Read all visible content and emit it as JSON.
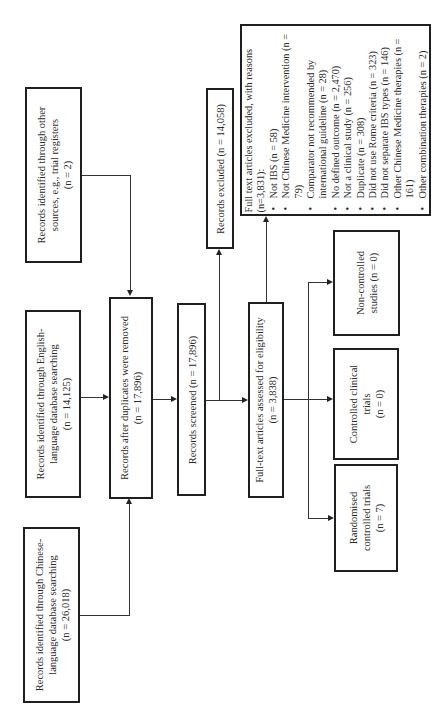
{
  "diagram_type": "PRISMA flow diagram (rotated 90° counter-clockwise)",
  "identification": {
    "chinese_db": {
      "line1": "Records identified through Chinese-",
      "line2": "language database searching",
      "n": "(n = 26,018)"
    },
    "english_db": {
      "line1": "Records identified through English-",
      "line2": "language database searching",
      "n": "(n = 14,125)"
    },
    "other_sources": {
      "line1": "Records identified through other",
      "line2": "sources, e.g., trial registers",
      "n": "(n = 2)"
    }
  },
  "after_duplicates": {
    "line1": "Records after duplicates were removed",
    "n": "(n = 17,896)"
  },
  "screened": {
    "label": "Records screened (n = 17,896)"
  },
  "records_excluded": {
    "label": "Records excluded (n = 14,058)"
  },
  "fulltext_assessed": {
    "line1": "Full-text articles assessed for eligibility",
    "n": "(n = 3,838)"
  },
  "fulltext_excluded": {
    "heading": "Full text articles excluded, with reasons (n=3,831):",
    "reasons": [
      "Not IBS (n = 58)",
      "Not Chinese Medicine intervention (n = 79)",
      "Comparator not recommended by international guideline (n = 28)",
      "No defined outcome (n = 2,470)",
      "Not a clinical study (n = 256)",
      "Duplicate (n = 308)",
      "Did not use Rome criteria (n = 323)",
      "Did not separate IBS types (n = 146)",
      "Other Chinese Medicine therapies (n = 161)",
      "Other combination therapies (n = 2)"
    ]
  },
  "included": {
    "non_controlled": {
      "line1": "Non-controlled",
      "line2": "studies (n = 0)"
    },
    "cct": {
      "line1": "Controlled clinical",
      "line2": "trials",
      "n": "(n = 0)"
    },
    "rct": {
      "line1": "Randomised",
      "line2": "controlled trials",
      "n": "(n = 7)"
    }
  }
}
